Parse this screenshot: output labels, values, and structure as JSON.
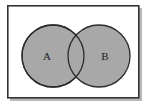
{
  "figure": {
    "type": "venn-diagram",
    "background_color": "#ffffff",
    "width": 153,
    "height": 112
  },
  "frame": {
    "name": "diagram-border",
    "x": 7,
    "y": 5,
    "width": 132,
    "height": 93,
    "border_color": "#333333",
    "border_width": 1.6,
    "fill_color": "#ffffff",
    "shadow_color": "#b9b9b9"
  },
  "sets": [
    {
      "id": "set-a",
      "label": "A",
      "cx": 53,
      "cy": 56,
      "r": 31,
      "fill_color": "#a8a8a8",
      "stroke_color": "#2b2b2b",
      "label_x": 47,
      "label_y": 57
    },
    {
      "id": "set-b",
      "label": "B",
      "cx": 99,
      "cy": 56,
      "r": 31,
      "fill_color": "#a8a8a8",
      "stroke_color": "#2b2b2b",
      "label_x": 105,
      "label_y": 57
    }
  ],
  "intersection": {
    "id": "set-intersection",
    "label": "",
    "fill_color": "#a8a8a8",
    "shaded": false
  }
}
